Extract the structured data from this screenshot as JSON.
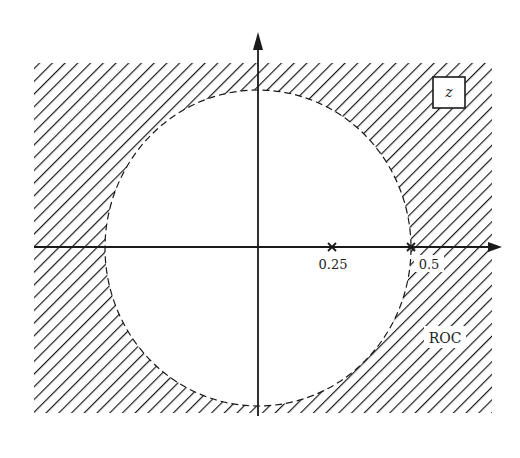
{
  "figure": {
    "type": "z-plane pole-zero diagram with region of convergence",
    "plane_label": "z",
    "region_label": "ROC",
    "axis": {
      "real_ticks": [
        {
          "value": 0.25,
          "label": "0.25"
        },
        {
          "value": 0.5,
          "label": "0.5"
        }
      ]
    },
    "poles": [
      {
        "real": 0.25,
        "imag": 0,
        "marker": "x"
      },
      {
        "real": 0.5,
        "imag": 0,
        "marker": "x"
      }
    ],
    "roc": {
      "description": "|z| > 0.5",
      "boundary": "dashed circle of radius 0.5",
      "shading": "diagonal hatching outside circle"
    },
    "colors": {
      "ink": "#1a1a1a",
      "background": "#ffffff"
    }
  }
}
